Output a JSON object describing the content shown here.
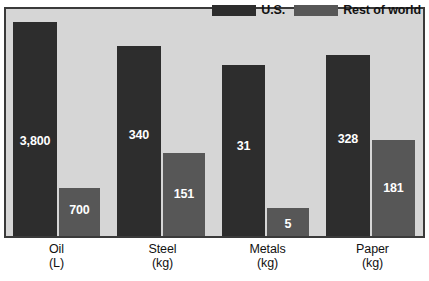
{
  "chart_data": {
    "type": "bar",
    "title": "",
    "xlabel": "",
    "ylabel": "",
    "grid": false,
    "legend_position": "top-right",
    "categories": [
      "Oil",
      "Steel",
      "Metals",
      "Paper"
    ],
    "category_units": [
      "(L)",
      "(kg)",
      "(kg)",
      "(kg)"
    ],
    "series": [
      {
        "name": "U.S.",
        "color": "#2d2d2d",
        "values": [
          3800,
          340,
          31,
          328
        ],
        "value_labels": [
          "3,800",
          "340",
          "31",
          "328"
        ]
      },
      {
        "name": "Rest of world",
        "color": "#575757",
        "values": [
          700,
          151,
          5,
          181
        ],
        "value_labels": [
          "700",
          "151",
          "5",
          "181"
        ]
      }
    ],
    "note": "Bars are scaled per-category, not on a single shared numeric axis."
  },
  "legend": {
    "items": [
      {
        "label": "U.S.",
        "color": "#2d2d2d"
      },
      {
        "label": "Rest of world",
        "color": "#575757"
      }
    ]
  },
  "colors": {
    "plot_background": "#d6d6d6",
    "page_background": "#ffffff",
    "frame_border": "#3a3a3a",
    "us_bar": "#2d2d2d",
    "row_bar": "#575757",
    "value_text": "#ffffff",
    "axis_text": "#111111"
  },
  "geometry": {
    "plot": {
      "left": 4,
      "top": 7,
      "width": 421,
      "height": 231
    },
    "groups": [
      {
        "category": "Oil",
        "us": {
          "x": 7,
          "w": 44,
          "h": 214
        },
        "row": {
          "x": 53,
          "w": 41,
          "h": 48
        },
        "label_x": 0,
        "label_w": 105
      },
      {
        "category": "Steel",
        "us": {
          "x": 111,
          "w": 44,
          "h": 190
        },
        "row": {
          "x": 157,
          "w": 42,
          "h": 83
        },
        "label_x": 106,
        "label_w": 105
      },
      {
        "category": "Metals",
        "us": {
          "x": 216,
          "w": 43,
          "h": 171
        },
        "row": {
          "x": 261,
          "w": 42,
          "h": 28
        },
        "label_x": 211,
        "label_w": 105
      },
      {
        "category": "Paper",
        "us": {
          "x": 320,
          "w": 44,
          "h": 181
        },
        "row": {
          "x": 366,
          "w": 43,
          "h": 96
        },
        "label_x": 316,
        "label_w": 105
      }
    ],
    "value_label_offsets_us": [
      113,
      83,
      75,
      78
    ],
    "value_label_offsets_row": [
      16,
      35,
      10,
      42
    ]
  }
}
